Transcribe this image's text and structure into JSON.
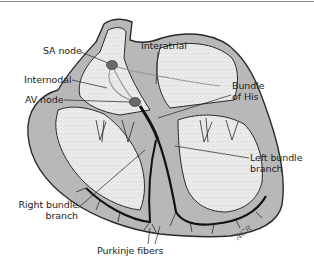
{
  "figure": {
    "labels": {
      "sa_node": "SA node",
      "internodal": "Internodal",
      "av_node": "AV node",
      "interatrial": "Interatrial",
      "bundle_of_his_line1": "Bundle",
      "bundle_of_his_line2": "of His",
      "left_bundle_line1": "Left bundle",
      "left_bundle_line2": "branch",
      "right_bundle_line1": "Right bundle",
      "right_bundle_line2": "branch",
      "purkinje": "Purkinje fibers"
    },
    "signature": "ACR",
    "colors": {
      "wall": "#b8b8b8",
      "chamber": "#e6e6e6",
      "outline": "#2a2a2a",
      "conduction": "#111111",
      "node": "#6a6a6a"
    }
  }
}
